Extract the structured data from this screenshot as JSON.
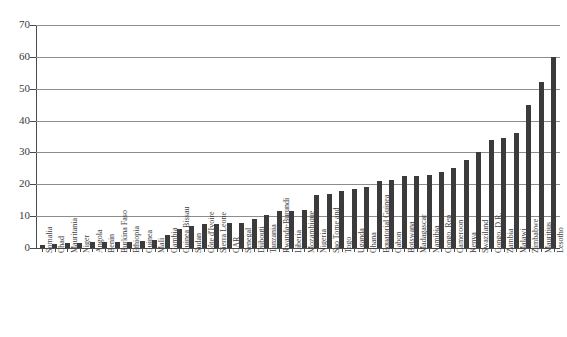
{
  "chart_data": {
    "type": "bar",
    "title": "",
    "subtitle": "",
    "xlabel": "",
    "ylabel": "",
    "ylim": [
      0,
      70
    ],
    "ytick_values": [
      0,
      10,
      20,
      30,
      40,
      50,
      60,
      70
    ],
    "ytick_labels": [
      "0",
      "10",
      "20",
      "30",
      "40",
      "50",
      "60",
      "70"
    ],
    "grid": "horizontal",
    "legend": "none",
    "bar_color": "#3b3b3b",
    "sorted": "ascending",
    "categories": [
      "Somalia",
      "Chad",
      "Mauritania",
      "Niger",
      "Angola",
      "Benin",
      "Burkina Faso",
      "Ethiopia",
      "Guinea",
      "Mali",
      "Gambia",
      "Guinea Bissau",
      "Sudan",
      "Côte d'Ivoire",
      "Sierra Leone",
      "CAR",
      "Senegal",
      "Djibouti",
      "Tanzania",
      "Rwanda-Burundi",
      "Liberia",
      "Mozambique",
      "Nigeria",
      "Sao Tome and",
      "Togo",
      "Uganda",
      "Ghana",
      "Equatorial Guinea",
      "Gabon",
      "Botswana",
      "Madagascar",
      "Namibia",
      "Congo. Rep",
      "Cameroon",
      "Kenya",
      "Swaziland",
      "Congo. D.R.",
      "Zambia",
      "Malawi",
      "Zimbabwe",
      "Mauritius",
      "Lesotho"
    ],
    "values": [
      1,
      1.2,
      1.5,
      1.5,
      1.8,
      2,
      2,
      2,
      2.2,
      2.5,
      4,
      6,
      7,
      7.5,
      7.5,
      8,
      8,
      9,
      10.5,
      11.5,
      11.5,
      12,
      16.5,
      17,
      18,
      18.5,
      19,
      21,
      21.5,
      22.5,
      22.5,
      23,
      24,
      25,
      27.5,
      30,
      34,
      34.5,
      36,
      45,
      52,
      60
    ]
  }
}
